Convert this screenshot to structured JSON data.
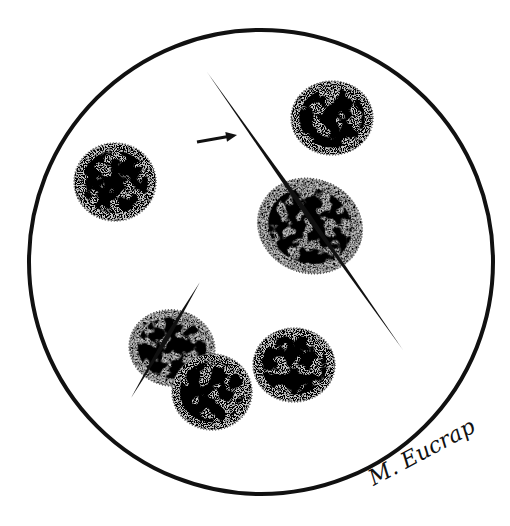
{
  "figure": {
    "kind": "microscopic field illustration",
    "background": "#ffffff",
    "ink": "#111111",
    "cell_fill": "#c9c9c9",
    "field": {
      "cx": 261,
      "cy": 262,
      "r": 232,
      "stroke_width": 4
    },
    "cells": [
      {
        "id": "cell-top-right",
        "cx": 332,
        "cy": 118,
        "rx": 41,
        "ry": 37,
        "rot": 0
      },
      {
        "id": "cell-left",
        "cx": 115,
        "cy": 182,
        "rx": 41,
        "ry": 39,
        "rot": 0
      },
      {
        "id": "cell-center-irregular",
        "cx": 310,
        "cy": 226,
        "rx": 53,
        "ry": 47,
        "rot": 20
      },
      {
        "id": "cell-lower-left-a",
        "cx": 172,
        "cy": 348,
        "rx": 43,
        "ry": 38,
        "rot": 10
      },
      {
        "id": "cell-lower-left-b",
        "cx": 212,
        "cy": 392,
        "rx": 40,
        "ry": 38,
        "rot": 0
      },
      {
        "id": "cell-lower-center",
        "cx": 294,
        "cy": 365,
        "rx": 41,
        "ry": 37,
        "rot": 0
      }
    ],
    "needles": [
      {
        "id": "needle-long",
        "x1": 207,
        "y1": 72,
        "x2": 403,
        "y2": 350,
        "width": 5
      },
      {
        "id": "needle-short",
        "x1": 200,
        "y1": 282,
        "x2": 131,
        "y2": 398,
        "width": 5
      }
    ],
    "arrow": {
      "x1": 197,
      "y1": 142,
      "x2": 237,
      "y2": 135
    },
    "signature": {
      "text": "M. Eucrap",
      "x": 362,
      "y": 470
    }
  }
}
